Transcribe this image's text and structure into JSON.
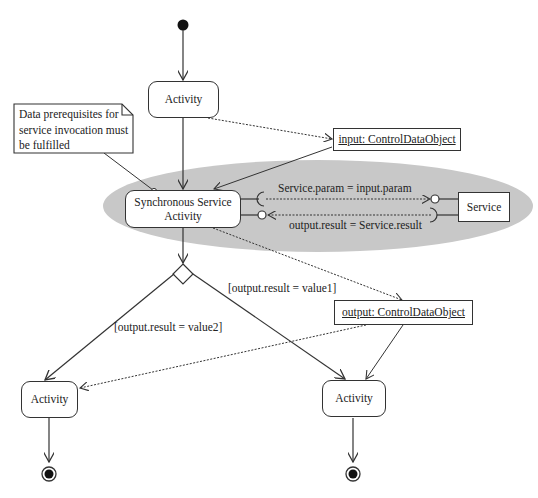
{
  "diagram": {
    "type": "UML activity diagram",
    "note": {
      "text_lines": [
        "Data prerequisites for",
        "service invocation must",
        "be fulfilled"
      ]
    },
    "nodes": {
      "activity_top": "Activity",
      "sync_activity_line1": "Synchronous Service",
      "sync_activity_line2": "Activity",
      "service": "Service",
      "input_object": "input: ControlDataObject",
      "output_object": "output: ControlDataObject",
      "activity_left": "Activity",
      "activity_right": "Activity"
    },
    "edge_labels": {
      "param_binding": "Service.param = input.param",
      "result_binding": "output.result = Service.result",
      "guard_value1": "[output.result = value1]",
      "guard_value2": "[output.result = value2]"
    },
    "colors": {
      "line": "#333333",
      "ellipse_fill": "#c8c8c8",
      "background": "#ffffff"
    }
  }
}
